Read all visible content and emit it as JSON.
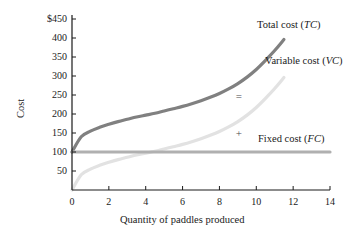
{
  "chart_data": {
    "type": "line",
    "title": "",
    "xlabel": "Quantity of paddles produced",
    "ylabel": "Cost",
    "xlim": [
      0,
      14
    ],
    "ylim": [
      0,
      450
    ],
    "grid": false,
    "legend_position": "inline-right",
    "xticks": [
      "0",
      "2",
      "4",
      "6",
      "8",
      "10",
      "12",
      "14"
    ],
    "xtick_values": [
      0,
      2,
      4,
      6,
      8,
      10,
      12,
      14
    ],
    "yticks": [
      "50",
      "100",
      "150",
      "200",
      "250",
      "300",
      "350",
      "400",
      "$450"
    ],
    "ytick_values": [
      50,
      100,
      150,
      200,
      250,
      300,
      350,
      400,
      450
    ],
    "x": [
      0,
      0.5,
      1,
      1.5,
      2,
      2.5,
      3,
      3.5,
      4,
      4.5,
      5,
      5.5,
      6,
      6.5,
      7,
      7.5,
      8,
      8.5,
      9,
      9.5,
      10,
      10.5,
      11,
      11.5
    ],
    "series": [
      {
        "name": "Total cost (TC)",
        "key": "TC",
        "color": "#808080",
        "width": 3.2,
        "values": [
          100,
          140,
          155,
          165,
          173,
          180,
          186,
          192,
          197,
          202,
          208,
          214,
          220,
          227,
          235,
          244,
          254,
          266,
          280,
          297,
          317,
          341,
          367,
          396
        ]
      },
      {
        "name": "Variable cost (VC)",
        "key": "VC",
        "color": "#e2e2e2",
        "width": 3.2,
        "values": [
          0,
          40,
          55,
          65,
          73,
          80,
          86,
          92,
          97,
          102,
          108,
          114,
          120,
          127,
          135,
          144,
          154,
          166,
          180,
          197,
          217,
          241,
          267,
          296
        ]
      },
      {
        "name": "Fixed cost (FC)",
        "key": "FC",
        "color": "#b0b0b0",
        "width": 3.2,
        "values": [
          100,
          100,
          100,
          100,
          100,
          100,
          100,
          100,
          100,
          100,
          100,
          100,
          100,
          100,
          100,
          100,
          100,
          100,
          100,
          100,
          100,
          100,
          100,
          100
        ],
        "x_end": 14
      }
    ],
    "annotations": [
      {
        "key": "equals",
        "text": "=",
        "x": 9.05,
        "y": 246
      },
      {
        "key": "plus",
        "text": "+",
        "x": 9.05,
        "y": 148
      }
    ],
    "curve_labels": [
      {
        "key": "tc",
        "prefix": "Total cost (",
        "symbol": "TC",
        "suffix": ")"
      },
      {
        "key": "vc",
        "prefix": "Variable cost (",
        "symbol": "VC",
        "suffix": ")"
      },
      {
        "key": "fc",
        "prefix": "Fixed cost (",
        "symbol": "FC",
        "suffix": ")"
      }
    ],
    "axis_color": "#1a1a1a"
  }
}
